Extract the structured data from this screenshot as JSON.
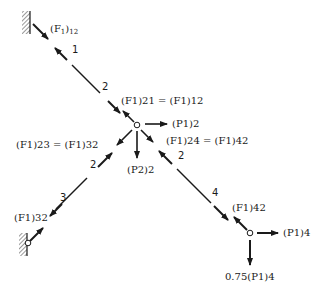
{
  "figure": {
    "members": [
      {
        "id": "1-2",
        "end_labels": [
          "1",
          "2"
        ]
      },
      {
        "id": "2-3",
        "end_labels": [
          "2",
          "3"
        ]
      },
      {
        "id": "2-4",
        "end_labels": [
          "2",
          "4"
        ]
      }
    ],
    "joints": {
      "support_top": {
        "label": "1"
      },
      "center": {
        "label": "2"
      },
      "support_bottom_left": {
        "label": "3"
      },
      "right": {
        "label": "4"
      }
    },
    "labels": {
      "f12_top": {
        "base": "(F",
        "sub1": "1",
        "close": ")",
        "sub2": "12"
      },
      "f21_eq": {
        "left": "(F1)21",
        "eq": "=",
        "right": "(F1)12"
      },
      "p1_2": "(P1)2",
      "f23_eq": {
        "left": "(F1)23",
        "eq": "=",
        "right": "(F1)32"
      },
      "p2_2": "(P2)2",
      "f24_eq": {
        "left": "(F1)24",
        "eq": "=",
        "right": "(F1)42"
      },
      "f32_bottom": "(F1)32",
      "f42_right": "(F1)42",
      "p1_4": "(P1)4",
      "p1_4_scaled": {
        "coef": "0.75",
        "term": "(P1)4"
      }
    },
    "member_numbers": {
      "n1": "1",
      "n2_upper": "2",
      "n2_left": "2",
      "n3": "3",
      "n2_right": "2",
      "n4": "4"
    },
    "colors": {
      "ink": "#1a1a1a",
      "background": "#ffffff"
    }
  }
}
